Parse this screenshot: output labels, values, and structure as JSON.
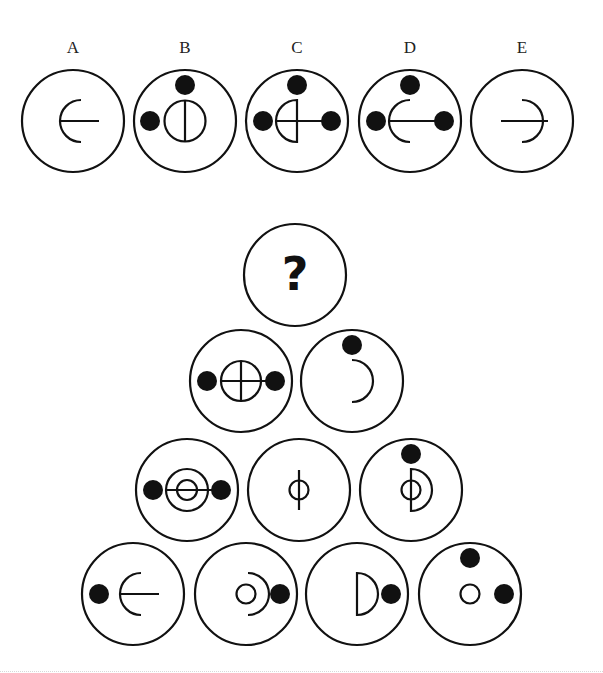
{
  "options": [
    {
      "label": "A",
      "cx": 73,
      "cy": 121
    },
    {
      "label": "B",
      "cx": 185,
      "cy": 121
    },
    {
      "label": "C",
      "cx": 297,
      "cy": 121
    },
    {
      "label": "D",
      "cx": 410,
      "cy": 121
    },
    {
      "label": "E",
      "cx": 522,
      "cy": 121
    }
  ],
  "pyramid": {
    "question_mark": "?",
    "rows": [
      [
        {
          "cx": 295,
          "cy": 275,
          "content": "question"
        }
      ],
      [
        {
          "cx": 241,
          "cy": 381,
          "content": "circle-cross-with-dots"
        },
        {
          "cx": 352,
          "cy": 381,
          "content": "right-arc-top-dot"
        }
      ],
      [
        {
          "cx": 187,
          "cy": 490,
          "content": "concentric-circles-bar-dots"
        },
        {
          "cx": 299,
          "cy": 490,
          "content": "small-circle-vertical-line"
        },
        {
          "cx": 411,
          "cy": 490,
          "content": "small-circle-half-disc-top-dot"
        }
      ],
      [
        {
          "cx": 133,
          "cy": 594,
          "content": "left-arc-line-left-dot"
        },
        {
          "cx": 246,
          "cy": 594,
          "content": "small-circle-right-arc-dot"
        },
        {
          "cx": 357,
          "cy": 594,
          "content": "half-disc-right-dot"
        },
        {
          "cx": 470,
          "cy": 594,
          "content": "small-circle-two-dots"
        }
      ]
    ]
  },
  "colors": {
    "stroke": "#111111",
    "fill": "#111111",
    "background": "#ffffff"
  }
}
